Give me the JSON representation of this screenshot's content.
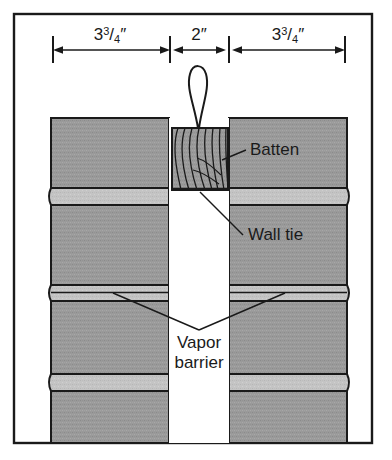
{
  "figure": {
    "frame": {
      "border_color": "#1a1a1a",
      "background_color": "#ffffff"
    },
    "colors": {
      "block_fill": "#9a9a9a",
      "mortar_fill": "#c4c4c4",
      "batten_fill": "#9a9a9a",
      "outline": "#1a1a1a",
      "cavity_fill": "#ffffff",
      "text": "#1a1a1a"
    },
    "dimensions": [
      {
        "id": "left-wythe",
        "label_whole": "3",
        "label_num": "3",
        "label_den": "4",
        "label_unit": "″",
        "label_text": "3¾″"
      },
      {
        "id": "cavity",
        "label_whole": "2",
        "label_num": "",
        "label_den": "",
        "label_unit": "″",
        "label_text": "2″"
      },
      {
        "id": "right-wythe",
        "label_whole": "3",
        "label_num": "3",
        "label_den": "4",
        "label_unit": "″",
        "label_text": "3¾″"
      }
    ],
    "callouts": [
      {
        "id": "batten",
        "label": "Batten"
      },
      {
        "id": "wall-tie",
        "label": "Wall tie"
      },
      {
        "id": "vapor-barrier-line1",
        "label": "Vapor"
      },
      {
        "id": "vapor-barrier-line2",
        "label": "barrier"
      }
    ]
  }
}
